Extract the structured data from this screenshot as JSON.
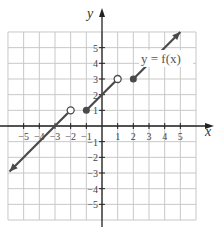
{
  "chart_data": {
    "type": "line",
    "title": "",
    "xlabel": "x",
    "ylabel": "y",
    "xlim": [
      -6,
      6
    ],
    "ylim": [
      -6,
      6
    ],
    "grid": true,
    "x_ticks": [
      -5,
      -4,
      -3,
      -2,
      -1,
      1,
      2,
      3,
      4,
      5
    ],
    "y_ticks": [
      -5,
      -4,
      -3,
      -2,
      -1,
      1,
      2,
      3,
      4,
      5
    ],
    "x_tick_labels": [
      "−5",
      "−4",
      "−3",
      "−2",
      "−1",
      "1",
      "2",
      "3",
      "4",
      "5"
    ],
    "y_tick_labels": [
      "−5",
      "−4",
      "−3",
      "−2",
      "−1",
      "1",
      "2",
      "3",
      "4",
      "5"
    ],
    "annotation": "y = f(x)",
    "series": [
      {
        "name": "piece-1",
        "equation": "y = x + 3",
        "domain": "x < -2",
        "points": [
          [
            -5.9,
            -2.9
          ],
          [
            -2,
            1
          ]
        ],
        "left_end": "arrow",
        "right_end": "open"
      },
      {
        "name": "piece-2",
        "equation": "y = x + 2",
        "domain": "-1 <= x < 1",
        "points": [
          [
            -1,
            1
          ],
          [
            1,
            3
          ]
        ],
        "left_end": "closed",
        "right_end": "open"
      },
      {
        "name": "piece-3",
        "equation": "y = x + 1",
        "domain": "x >= 2",
        "points": [
          [
            2,
            3
          ],
          [
            5,
            6
          ]
        ],
        "left_end": "closed",
        "right_end": "arrow"
      }
    ]
  },
  "labels": {
    "x_axis": "x",
    "y_axis": "y",
    "function": "y = f(x)"
  },
  "colors": {
    "grid": "#c8c8c8",
    "axis": "#222222",
    "curve": "#4a4a4a"
  }
}
